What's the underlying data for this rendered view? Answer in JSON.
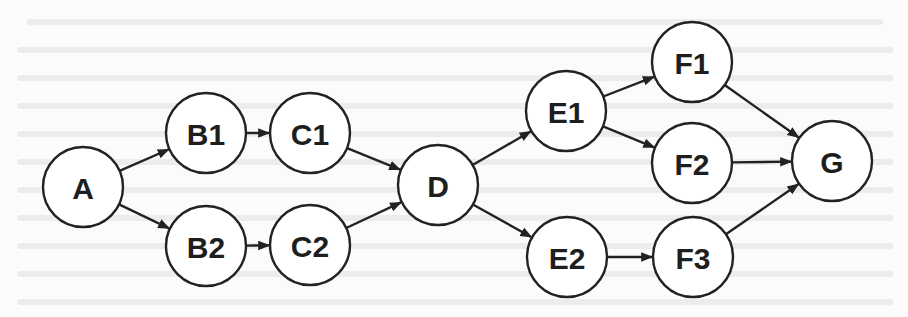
{
  "diagram": {
    "type": "directed-graph",
    "direction": "left-to-right",
    "colors": {
      "background": "#fbfbf9",
      "stroke": "#222222",
      "node_fill": "#ffffff",
      "label": "#1e1e1e"
    },
    "nodes": [
      {
        "id": "A",
        "label": "A",
        "x": 83,
        "y": 187
      },
      {
        "id": "B1",
        "label": "B1",
        "x": 206,
        "y": 133
      },
      {
        "id": "B2",
        "label": "B2",
        "x": 206,
        "y": 246
      },
      {
        "id": "C1",
        "label": "C1",
        "x": 310,
        "y": 133
      },
      {
        "id": "C2",
        "label": "C2",
        "x": 310,
        "y": 245
      },
      {
        "id": "D",
        "label": "D",
        "x": 438,
        "y": 185
      },
      {
        "id": "E1",
        "label": "E1",
        "x": 566,
        "y": 111
      },
      {
        "id": "E2",
        "label": "E2",
        "x": 567,
        "y": 257
      },
      {
        "id": "F1",
        "label": "F1",
        "x": 692,
        "y": 62
      },
      {
        "id": "F2",
        "label": "F2",
        "x": 692,
        "y": 163
      },
      {
        "id": "F3",
        "label": "F3",
        "x": 693,
        "y": 257
      },
      {
        "id": "G",
        "label": "G",
        "x": 832,
        "y": 161
      }
    ],
    "edges": [
      {
        "from": "A",
        "to": "B1"
      },
      {
        "from": "A",
        "to": "B2"
      },
      {
        "from": "B1",
        "to": "C1"
      },
      {
        "from": "B2",
        "to": "C2"
      },
      {
        "from": "C1",
        "to": "D"
      },
      {
        "from": "C2",
        "to": "D"
      },
      {
        "from": "D",
        "to": "E1"
      },
      {
        "from": "D",
        "to": "E2"
      },
      {
        "from": "E1",
        "to": "F1"
      },
      {
        "from": "E1",
        "to": "F2"
      },
      {
        "from": "E2",
        "to": "F3"
      },
      {
        "from": "F1",
        "to": "G"
      },
      {
        "from": "F2",
        "to": "G"
      },
      {
        "from": "F3",
        "to": "G"
      }
    ]
  }
}
